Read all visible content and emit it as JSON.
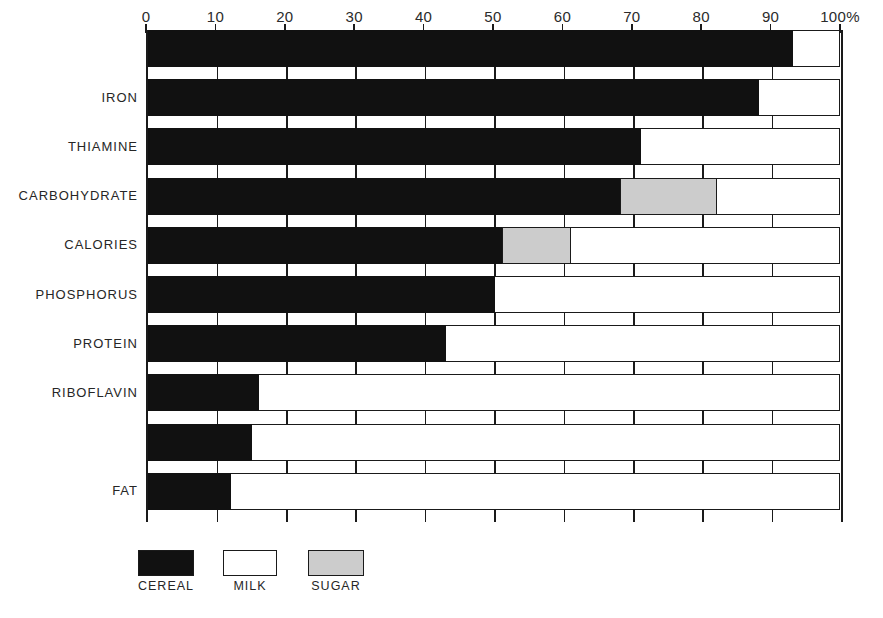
{
  "chart_data": {
    "type": "bar",
    "orientation": "horizontal",
    "stacked": true,
    "title": "",
    "subtitle": "",
    "xlabel": "",
    "ylabel": "",
    "xlim": [
      0,
      100
    ],
    "grid": true,
    "legend_position": "bottom-left",
    "axis": {
      "tick_values": [
        0,
        10,
        20,
        30,
        40,
        50,
        60,
        70,
        80,
        90,
        100
      ],
      "tick_labels": [
        "0",
        "10",
        "20",
        "30",
        "40",
        "50",
        "60",
        "70",
        "80",
        "90",
        "100%"
      ],
      "unit": "%"
    },
    "categories": [
      "",
      "IRON",
      "THIAMINE",
      "CARBOHYDRATE",
      "CALORIES",
      "PHOSPHORUS",
      "PROTEIN",
      "RIBOFLAVIN",
      "",
      "FAT"
    ],
    "series": [
      {
        "name": "CEREAL",
        "color": "#111111",
        "values": [
          93,
          88,
          71,
          68,
          51,
          50,
          43,
          16,
          15,
          12
        ]
      },
      {
        "name": "SUGAR",
        "color": "#cccccc",
        "values": [
          0,
          0,
          0,
          14,
          10,
          0,
          0,
          0,
          0,
          0
        ]
      },
      {
        "name": "MILK",
        "color": "#ffffff",
        "values": [
          7,
          12,
          29,
          18,
          39,
          50,
          57,
          84,
          85,
          88
        ]
      }
    ]
  },
  "legend": {
    "items": [
      {
        "label": "CEREAL",
        "color": "#111111"
      },
      {
        "label": "MILK",
        "color": "#ffffff"
      },
      {
        "label": "SUGAR",
        "color": "#cccccc"
      }
    ]
  }
}
